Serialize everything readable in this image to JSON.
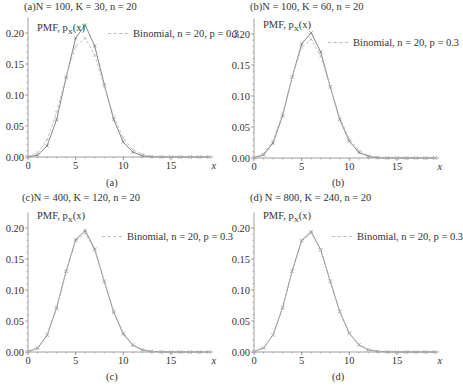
{
  "chart_data": [
    {
      "type": "line",
      "panel": "a",
      "title": "(a)N = 100, K = 30, n = 20",
      "caption": "(a)",
      "ylabel": "PMF, p_X(x)",
      "xlabel": "x",
      "xlim": [
        0,
        19
      ],
      "ylim": [
        0,
        0.22
      ],
      "xticks": [
        0,
        5,
        10,
        15
      ],
      "yticks": [
        "0.00",
        "0.05",
        "0.10",
        "0.15",
        "0.20"
      ],
      "x": [
        0,
        1,
        2,
        3,
        4,
        5,
        6,
        7,
        8,
        9,
        10,
        11,
        12,
        13,
        14,
        15,
        16,
        17,
        18,
        19
      ],
      "series": [
        {
          "name": "Hypergeometric",
          "style": "solid",
          "values": [
            0.0002,
            0.003,
            0.018,
            0.06,
            0.128,
            0.192,
            0.213,
            0.179,
            0.117,
            0.06,
            0.024,
            0.008,
            0.002,
            0.0004,
            0.0001,
            0,
            0,
            0,
            0,
            0
          ]
        },
        {
          "name": "Binomial, n = 20, p = 0.3",
          "style": "dashed",
          "values": [
            0.0008,
            0.0068,
            0.0278,
            0.0716,
            0.1304,
            0.1789,
            0.1916,
            0.1643,
            0.1144,
            0.0654,
            0.0308,
            0.012,
            0.0039,
            0.001,
            0.0002,
            0,
            0,
            0,
            0,
            0
          ]
        }
      ]
    },
    {
      "type": "line",
      "panel": "b",
      "title": "(b)N = 100, K = 60, n = 20",
      "caption": "(b)",
      "ylabel": "PMF, p_X(x)",
      "xlabel": "x",
      "xlim": [
        0,
        19
      ],
      "ylim": [
        0,
        0.22
      ],
      "xticks": [
        0,
        5,
        10,
        15
      ],
      "yticks": [
        "0.00",
        "0.05",
        "0.10",
        "0.15",
        "0.20"
      ],
      "x": [
        0,
        1,
        2,
        3,
        4,
        5,
        6,
        7,
        8,
        9,
        10,
        11,
        12,
        13,
        14,
        15,
        16,
        17,
        18,
        19
      ],
      "series": [
        {
          "name": "Hypergeometric",
          "style": "solid",
          "values": [
            0.0005,
            0.005,
            0.024,
            0.068,
            0.13,
            0.184,
            0.202,
            0.171,
            0.115,
            0.062,
            0.027,
            0.009,
            0.0025,
            0.0006,
            0.0001,
            0,
            0,
            0,
            0,
            0
          ]
        },
        {
          "name": "Binomial, n = 20, p = 0.3",
          "style": "dashed",
          "values": [
            0.0008,
            0.0068,
            0.0278,
            0.0716,
            0.1304,
            0.1789,
            0.1916,
            0.1643,
            0.1144,
            0.0654,
            0.0308,
            0.012,
            0.0039,
            0.001,
            0.0002,
            0,
            0,
            0,
            0,
            0
          ]
        }
      ]
    },
    {
      "type": "line",
      "panel": "c",
      "title": "(c)N = 400, K = 120, n = 20",
      "caption": "(c)",
      "ylabel": "PMF, p_X(x)",
      "xlabel": "x",
      "xlim": [
        0,
        19
      ],
      "ylim": [
        0,
        0.22
      ],
      "xticks": [
        0,
        5,
        10,
        15
      ],
      "yticks": [
        "0.00",
        "0.05",
        "0.10",
        "0.15",
        "0.20"
      ],
      "x": [
        0,
        1,
        2,
        3,
        4,
        5,
        6,
        7,
        8,
        9,
        10,
        11,
        12,
        13,
        14,
        15,
        16,
        17,
        18,
        19
      ],
      "series": [
        {
          "name": "Hypergeometric",
          "style": "solid",
          "values": [
            0.0007,
            0.006,
            0.027,
            0.071,
            0.13,
            0.181,
            0.196,
            0.166,
            0.114,
            0.064,
            0.029,
            0.011,
            0.0033,
            0.0008,
            0.0002,
            0,
            0,
            0,
            0,
            0
          ]
        },
        {
          "name": "Binomial, n = 20, p = 0.3",
          "style": "dashed",
          "values": [
            0.0008,
            0.0068,
            0.0278,
            0.0716,
            0.1304,
            0.1789,
            0.1916,
            0.1643,
            0.1144,
            0.0654,
            0.0308,
            0.012,
            0.0039,
            0.001,
            0.0002,
            0,
            0,
            0,
            0,
            0
          ]
        }
      ]
    },
    {
      "type": "line",
      "panel": "d",
      "title": "(d) N = 800, K = 240, n = 20",
      "caption": "(d)",
      "ylabel": "PMF, p_X(x)",
      "xlabel": "x",
      "xlim": [
        0,
        19
      ],
      "ylim": [
        0,
        0.22
      ],
      "xticks": [
        0,
        5,
        10,
        15
      ],
      "yticks": [
        "0.00",
        "0.05",
        "0.10",
        "0.15",
        "0.20"
      ],
      "x": [
        0,
        1,
        2,
        3,
        4,
        5,
        6,
        7,
        8,
        9,
        10,
        11,
        12,
        13,
        14,
        15,
        16,
        17,
        18,
        19
      ],
      "series": [
        {
          "name": "Hypergeometric",
          "style": "solid",
          "values": [
            0.0007,
            0.0065,
            0.0275,
            0.0713,
            0.1304,
            0.18,
            0.194,
            0.165,
            0.114,
            0.065,
            0.03,
            0.0115,
            0.0036,
            0.0009,
            0.0002,
            0,
            0,
            0,
            0,
            0
          ]
        },
        {
          "name": "Binomial, n = 20, p = 0.3",
          "style": "dashed",
          "values": [
            0.0008,
            0.0068,
            0.0278,
            0.0716,
            0.1304,
            0.1789,
            0.1916,
            0.1643,
            0.1144,
            0.0654,
            0.0308,
            0.012,
            0.0039,
            0.001,
            0.0002,
            0,
            0,
            0,
            0,
            0
          ]
        }
      ]
    }
  ],
  "panels": [
    {
      "title": "(a)N = 100, K = 30, n = 20",
      "caption": "(a)",
      "pmf_label": "PMF, p",
      "pmf_sub": "X",
      "pmf_arg": "(x)",
      "legend": "Binomial, n = 20, p = 0.3",
      "xlabel": "x"
    },
    {
      "title": "(b)N = 100, K = 60, n = 20",
      "caption": "(b)",
      "pmf_label": "PMF, p",
      "pmf_sub": "X",
      "pmf_arg": "(x)",
      "legend": "Binomial, n = 20, p = 0.3",
      "xlabel": "x"
    },
    {
      "title": "(c)N = 400, K = 120, n = 20",
      "caption": "(c)",
      "pmf_label": "PMF, p",
      "pmf_sub": "X",
      "pmf_arg": "(x)",
      "legend": "Binomial, n = 20, p = 0.3",
      "xlabel": "x"
    },
    {
      "title": "(d) N = 800, K = 240, n = 20",
      "caption": "(d)",
      "pmf_label": "PMF, p",
      "pmf_sub": "X",
      "pmf_arg": "(x)",
      "legend": "Binomial, n = 20, p = 0.3",
      "xlabel": "x"
    }
  ],
  "colors": {
    "hyper": "#777777",
    "binom": "#bbbbbb",
    "axis": "#888888",
    "text": "#333333"
  }
}
